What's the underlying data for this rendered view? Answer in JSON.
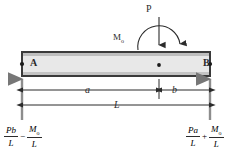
{
  "diagram": {
    "colors": {
      "beam_fill": "#e8e8e8",
      "beam_stroke": "#3a3a3a",
      "line": "#2b2b2b",
      "background": "#ffffff"
    },
    "beam": {
      "left_support_label": "A",
      "right_support_label": "B"
    },
    "loads": {
      "point_load_label": "P",
      "moment_label": "M",
      "moment_subscript": "o"
    },
    "dimensions": {
      "segment_a_label": "a",
      "segment_b_label": "b",
      "total_length_label": "L"
    },
    "reactions": {
      "left": {
        "term1_num": "Pb",
        "term1_den": "L",
        "operator": "−",
        "term2_num": "M",
        "term2_sub": "o",
        "term2_den": "L"
      },
      "right": {
        "term1_num": "Pa",
        "term1_den": "L",
        "operator": "+",
        "term2_num": "M",
        "term2_sub": "o",
        "term2_den": "L"
      }
    }
  }
}
